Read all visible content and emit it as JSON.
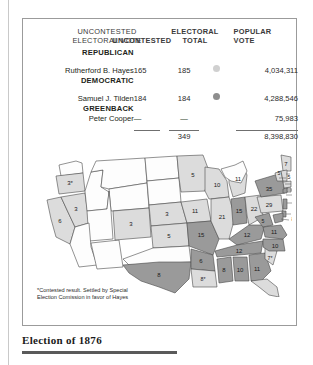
{
  "figure": {
    "caption": "Election of 1876",
    "footnote": "*Contested result. Settled by Special Election Comission in favor of Hayes"
  },
  "table": {
    "headers": {
      "name": "",
      "uncontested_line1": "UNCONTESTED",
      "uncontested_line2": "ELECTORAL VOTE",
      "electoral_line1": "ELECTORAL",
      "electoral_line2": "TOTAL",
      "popular_line1": "POPULAR",
      "popular_line2": "VOTE"
    },
    "rows": [
      {
        "party": "REPUBLICAN",
        "candidate": "Rutherford B. Hayes",
        "uncontested": "165",
        "electoral_total": "185",
        "dot_color": "#d0d0d0",
        "popular_vote": "4,034,311"
      },
      {
        "party": "DEMOCRATIC",
        "candidate": "Samuel J. Tilden",
        "uncontested": "184",
        "electoral_total": "184",
        "dot_color": "#8e8e8e",
        "popular_vote": "4,288,546"
      },
      {
        "party": "GREENBACK",
        "candidate": "Peter Cooper",
        "uncontested": "—",
        "electoral_total": "—",
        "dot_color": "",
        "popular_vote": "75,983"
      }
    ],
    "totals": {
      "uncontested": "",
      "electoral_total": "349",
      "popular_vote": "8,398,830"
    }
  },
  "map": {
    "legend_colors": {
      "republican": "#dcdcdc",
      "democratic": "#9a9a9a"
    },
    "states": [
      {
        "code": "WA",
        "label": "",
        "party": "none"
      },
      {
        "code": "OR",
        "label": "3*",
        "party": "republican"
      },
      {
        "code": "CA",
        "label": "6",
        "party": "republican"
      },
      {
        "code": "NV",
        "label": "3",
        "party": "republican"
      },
      {
        "code": "ID",
        "label": "",
        "party": "none"
      },
      {
        "code": "MT",
        "label": "",
        "party": "none"
      },
      {
        "code": "WY",
        "label": "",
        "party": "none"
      },
      {
        "code": "UT",
        "label": "",
        "party": "none"
      },
      {
        "code": "AZ",
        "label": "",
        "party": "none"
      },
      {
        "code": "NM",
        "label": "",
        "party": "none"
      },
      {
        "code": "CO",
        "label": "3",
        "party": "republican"
      },
      {
        "code": "ND",
        "label": "",
        "party": "none"
      },
      {
        "code": "SD",
        "label": "",
        "party": "none"
      },
      {
        "code": "NE",
        "label": "3",
        "party": "republican"
      },
      {
        "code": "KS",
        "label": "5",
        "party": "republican"
      },
      {
        "code": "OK",
        "label": "",
        "party": "none"
      },
      {
        "code": "TX",
        "label": "8",
        "party": "democratic"
      },
      {
        "code": "MN",
        "label": "5",
        "party": "republican"
      },
      {
        "code": "IA",
        "label": "11",
        "party": "republican"
      },
      {
        "code": "MO",
        "label": "15",
        "party": "democratic"
      },
      {
        "code": "AR",
        "label": "6",
        "party": "democratic"
      },
      {
        "code": "LA",
        "label": "8*",
        "party": "republican"
      },
      {
        "code": "WI",
        "label": "10",
        "party": "republican"
      },
      {
        "code": "IL",
        "label": "21",
        "party": "republican"
      },
      {
        "code": "MI",
        "label": "11",
        "party": "republican"
      },
      {
        "code": "IN",
        "label": "15",
        "party": "democratic"
      },
      {
        "code": "OH",
        "label": "22",
        "party": "republican"
      },
      {
        "code": "KY",
        "label": "12",
        "party": "democratic"
      },
      {
        "code": "TN",
        "label": "12",
        "party": "democratic"
      },
      {
        "code": "MS",
        "label": "8",
        "party": "democratic"
      },
      {
        "code": "AL",
        "label": "10",
        "party": "democratic"
      },
      {
        "code": "GA",
        "label": "11",
        "party": "democratic"
      },
      {
        "code": "FL",
        "label": "4*",
        "party": "republican"
      },
      {
        "code": "SC",
        "label": "7*",
        "party": "republican"
      },
      {
        "code": "NC",
        "label": "10",
        "party": "democratic"
      },
      {
        "code": "VA",
        "label": "11",
        "party": "democratic"
      },
      {
        "code": "WV",
        "label": "5",
        "party": "democratic"
      },
      {
        "code": "PA",
        "label": "29",
        "party": "republican"
      },
      {
        "code": "NY",
        "label": "35",
        "party": "democratic"
      },
      {
        "code": "VT",
        "label": "5",
        "party": "republican"
      },
      {
        "code": "ME",
        "label": "7",
        "party": "republican"
      },
      {
        "code": "NH",
        "label": "5",
        "party": "republican"
      },
      {
        "code": "MA",
        "label": "13",
        "party": "republican"
      },
      {
        "code": "RI",
        "label": "4",
        "party": "republican"
      },
      {
        "code": "CT",
        "label": "6",
        "party": "democratic"
      },
      {
        "code": "NJ",
        "label": "9",
        "party": "democratic"
      },
      {
        "code": "DE",
        "label": "3",
        "party": "democratic"
      },
      {
        "code": "MD",
        "label": "8",
        "party": "democratic"
      }
    ]
  }
}
